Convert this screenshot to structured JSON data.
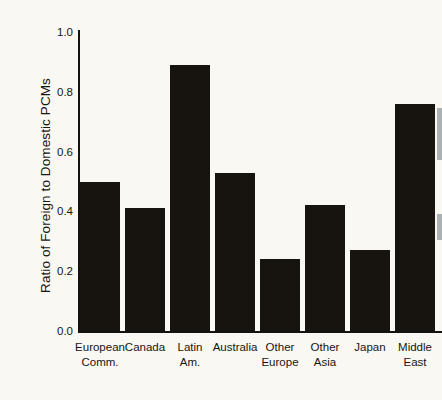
{
  "chart_data": {
    "type": "bar",
    "title": "",
    "xlabel": "",
    "ylabel": "Ratio of Foreign to Domestic PCMs",
    "categories": [
      "European Comm.",
      "Canada",
      "Latin Am.",
      "Australia",
      "Other Europe",
      "Other Asia",
      "Japan",
      "Middle East"
    ],
    "category_lines": [
      [
        "European",
        "Comm."
      ],
      [
        "Canada",
        ""
      ],
      [
        "Latin",
        "Am."
      ],
      [
        "Australia",
        ""
      ],
      [
        "Other",
        "Europe"
      ],
      [
        "Other",
        "Asia"
      ],
      [
        "Japan",
        ""
      ],
      [
        "Middle",
        "East"
      ]
    ],
    "values": [
      0.5,
      0.41,
      0.89,
      0.53,
      0.24,
      0.42,
      0.27,
      0.76
    ],
    "ylim": [
      0.0,
      1.0
    ],
    "yticks": [
      0.0,
      0.2,
      0.4,
      0.6,
      0.8,
      1.0
    ],
    "ytick_labels": [
      "0.0",
      "0.2",
      "0.4",
      "0.6",
      "0.8",
      "1.0"
    ],
    "grid": false,
    "legend": "none",
    "bar_color": "#17130f",
    "background_color": "#faf8f3",
    "axis_color": "#15120f",
    "note": "Last bar (Middle East) is clipped by the right edge of the image."
  }
}
